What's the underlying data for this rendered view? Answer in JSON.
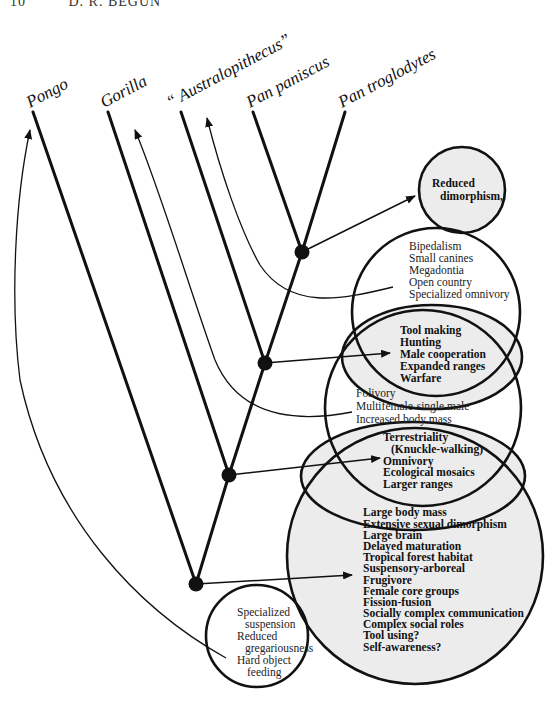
{
  "header": {
    "page_number": "10",
    "author": "D. R. BEGUN"
  },
  "taxa": [
    {
      "id": "pongo",
      "label": "Pongo"
    },
    {
      "id": "gorilla",
      "label": "Gorilla"
    },
    {
      "id": "australopithecus",
      "label": "“ Australopithecus”"
    },
    {
      "id": "pan-paniscus",
      "label": "Pan paniscus"
    },
    {
      "id": "pan-troglodytes",
      "label": "Pan troglodytes"
    }
  ],
  "trait_groups": {
    "reduced_dimorphism": {
      "shaded": true,
      "items": [
        "Reduced",
        "dimorphism,"
      ]
    },
    "hominin": {
      "shaded": false,
      "items": [
        "Bipedalism",
        "Small canines",
        "Megadontia",
        "Open country",
        "Specialized omnivory"
      ]
    },
    "pan_homo": {
      "shaded": true,
      "items": [
        "Tool making",
        "Hunting",
        "Male cooperation",
        "Expanded ranges",
        "Warfare"
      ]
    },
    "gorilla": {
      "shaded": false,
      "items": [
        "Folivory",
        "Multifemale-single male",
        "Increased body mass"
      ]
    },
    "african_ape": {
      "shaded": true,
      "items": [
        "Terrestriality",
        "(Knuckle-walking)",
        "Omnivory",
        "Ecological mosaics",
        "Larger ranges"
      ]
    },
    "great_ape": {
      "shaded": true,
      "items": [
        "Large body mass",
        "Extensive sexual dimorphism",
        "Large brain",
        "Delayed maturation",
        "Tropical forest habitat",
        "Suspensory-arboreal",
        "Frugivore",
        "Female core groups",
        "Fission-fusion",
        "Socially complex communication",
        "Complex social roles",
        "Tool using?",
        "Self-awareness?"
      ]
    },
    "pongo": {
      "shaded": false,
      "items": [
        "Specialized",
        "suspension",
        "Reduced",
        "gregariousness",
        "Hard object",
        "feeding"
      ]
    }
  },
  "colors": {
    "line": "#111111",
    "shade": "#ececec",
    "background": "#ffffff"
  }
}
